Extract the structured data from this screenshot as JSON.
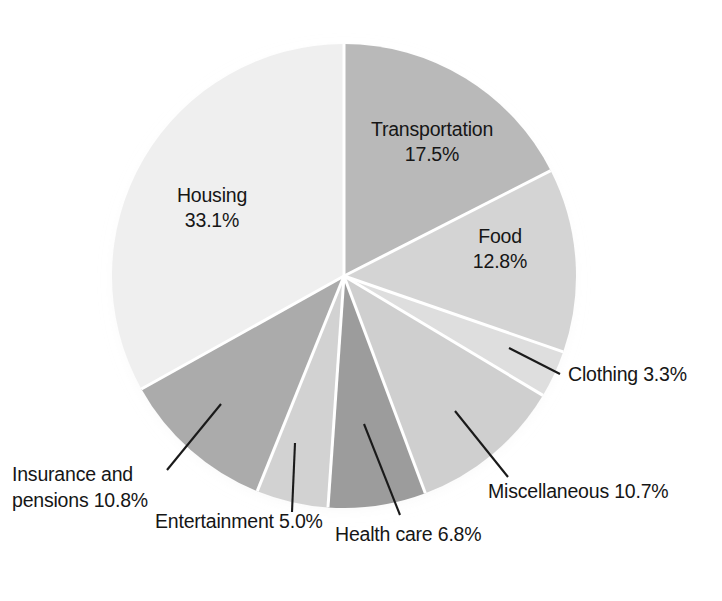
{
  "chart_data": {
    "type": "pie",
    "title": "",
    "subtitle": "",
    "xlabel": "",
    "ylabel": "",
    "legend_position": "none",
    "grid": false,
    "units": "percent",
    "labels_include_percent": true,
    "start_angle_deg": 0,
    "direction": "clockwise",
    "categories": [
      "Transportation",
      "Food",
      "Clothing",
      "Miscellaneous",
      "Health care",
      "Entertainment",
      "Insurance and pensions",
      "Housing"
    ],
    "values": [
      17.5,
      12.8,
      3.3,
      10.7,
      6.8,
      5.0,
      10.8,
      33.1
    ],
    "total": 100.0,
    "slices": [
      {
        "name": "Transportation",
        "value": 17.5,
        "value_text": "17.5%",
        "label_line1": "Transportation",
        "label_line2": "17.5%",
        "color": "#b9b9b9",
        "label_placement": "inside"
      },
      {
        "name": "Food",
        "value": 12.8,
        "value_text": "12.8%",
        "label_line1": "Food",
        "label_line2": "12.8%",
        "color": "#d4d4d4",
        "label_placement": "inside"
      },
      {
        "name": "Clothing",
        "value": 3.3,
        "value_text": "3.3%",
        "label_line1": "Clothing 3.3%",
        "label_line2": "",
        "color": "#dedede",
        "label_placement": "callout"
      },
      {
        "name": "Miscellaneous",
        "value": 10.7,
        "value_text": "10.7%",
        "label_line1": "Miscellaneous 10.7%",
        "label_line2": "",
        "color": "#cfcfcf",
        "label_placement": "callout"
      },
      {
        "name": "Health care",
        "value": 6.8,
        "value_text": "6.8%",
        "label_line1": "Health care 6.8%",
        "label_line2": "",
        "color": "#9c9c9c",
        "label_placement": "callout"
      },
      {
        "name": "Entertainment",
        "value": 5.0,
        "value_text": "5.0%",
        "label_line1": "Entertainment 5.0%",
        "label_line2": "",
        "color": "#d2d2d2",
        "label_placement": "callout"
      },
      {
        "name": "Insurance and pensions",
        "value": 10.8,
        "value_text": "10.8%",
        "label_line1": "Insurance and",
        "label_line2": "pensions 10.8%",
        "color": "#ababab",
        "label_placement": "callout"
      },
      {
        "name": "Housing",
        "value": 33.1,
        "value_text": "33.1%",
        "label_line1": "Housing",
        "label_line2": "33.1%",
        "color": "#efefef",
        "label_placement": "inside"
      }
    ]
  },
  "colors": {
    "background": "#ffffff",
    "text": "#161616",
    "separator": "#ffffff",
    "leader_line": "#1a1a1a"
  }
}
